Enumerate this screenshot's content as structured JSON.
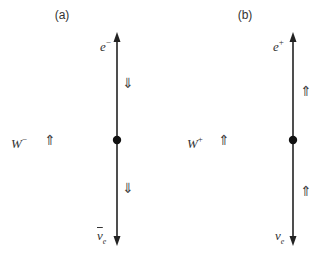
{
  "panels": [
    {
      "label": "(a)",
      "top_particle": {
        "symbol": "e",
        "charge": "−"
      },
      "bottom_particle": {
        "symbol": "ν",
        "sub": "e",
        "antiparticle": true
      },
      "boson": {
        "symbol": "W",
        "charge": "−"
      },
      "boson_spin": "⇑",
      "upper_spin": "⇓",
      "lower_spin": "⇓"
    },
    {
      "label": "(b)",
      "top_particle": {
        "symbol": "e",
        "charge": "+"
      },
      "bottom_particle": {
        "symbol": "ν",
        "sub": "e",
        "antiparticle": false
      },
      "boson": {
        "symbol": "W",
        "charge": "+"
      },
      "boson_spin": "⇑",
      "upper_spin": "⇑",
      "lower_spin": "⇑"
    }
  ],
  "colors": {
    "line": "#222222",
    "text": "#333333"
  }
}
